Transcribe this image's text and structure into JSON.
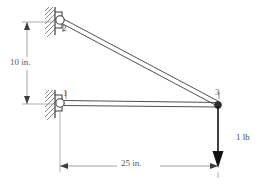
{
  "figure": {
    "type": "truss-free-body-diagram",
    "title": "",
    "background_color": "#ffffff",
    "line_color": "#3c3c3c",
    "dimension_color": "#5a5a5a",
    "text_color": "#4a4a4a"
  },
  "joints": [
    {
      "id": "2",
      "label": "2",
      "x": 60,
      "y": 20,
      "support": "pin",
      "support_side": "left"
    },
    {
      "id": "1",
      "label": "1",
      "x": 60,
      "y": 103,
      "support": "pin",
      "support_side": "left"
    },
    {
      "id": "3",
      "label": "3",
      "x": 218,
      "y": 105,
      "support": "none",
      "support_side": ""
    }
  ],
  "members": [
    {
      "id": "member-2-3",
      "from": "2",
      "to": "3",
      "style": "double-line"
    },
    {
      "id": "member-1-3",
      "from": "1",
      "to": "3",
      "style": "double-line"
    }
  ],
  "load": {
    "label": "1 lb",
    "magnitude": 1,
    "unit": "lb",
    "direction": "down",
    "applied_at_joint": "3"
  },
  "dimensions": [
    {
      "id": "dim-vertical",
      "label": "10 in.",
      "value": 10,
      "unit": "in.",
      "orientation": "vertical",
      "between": [
        "2",
        "1"
      ]
    },
    {
      "id": "dim-horizontal",
      "label": "25 in.",
      "value": 25,
      "unit": "in.",
      "orientation": "horizontal",
      "between": [
        "1",
        "3"
      ]
    }
  ],
  "supports": [
    {
      "id": "support-upper",
      "joint": "2",
      "type": "pin-on-wall",
      "hatched": true
    },
    {
      "id": "support-lower",
      "joint": "1",
      "type": "pin-on-wall",
      "hatched": true
    }
  ]
}
